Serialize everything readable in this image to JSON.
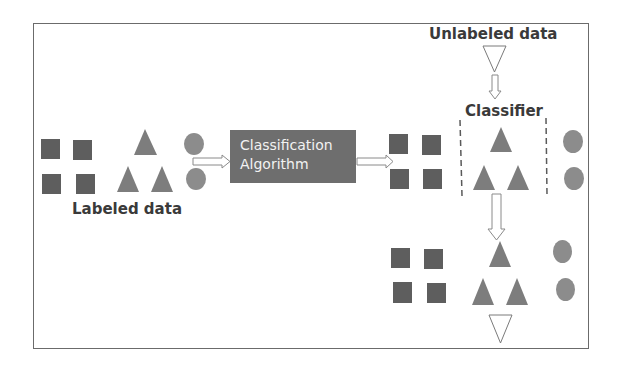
{
  "diagram": {
    "labels": {
      "labeled_data": "Labeled data",
      "unlabeled_data": "Unlabeled data",
      "classifier": "Classifier"
    },
    "algorithm_box": {
      "line1": "Classification",
      "line2": "Algorithm"
    },
    "colors": {
      "square": "#5e5e5e",
      "triangle": "#7d7d7d",
      "circle": "#8c8c8c",
      "box": "#6e6e6e",
      "box_text": "#f2f2f2",
      "label_text": "#3a3a3a",
      "frame": "#6b6b6b"
    },
    "groups": [
      {
        "name": "labeled-input",
        "squares": 4,
        "triangles": 3,
        "circles": 2
      },
      {
        "name": "classified-output",
        "squares": 4,
        "triangles": 3,
        "circles": 2
      },
      {
        "name": "prediction-result",
        "squares": 4,
        "triangles": 3,
        "circles": 2
      }
    ]
  }
}
